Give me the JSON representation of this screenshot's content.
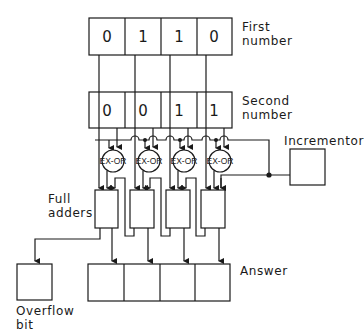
{
  "diagram": {
    "first_number": {
      "label": "First\nnumber",
      "label_lines": [
        "First",
        "number"
      ],
      "bits": [
        "0",
        "1",
        "1",
        "0"
      ]
    },
    "second_number": {
      "label_lines": [
        "Second",
        "number"
      ],
      "bits": [
        "0",
        "0",
        "1",
        "1"
      ]
    },
    "gates": {
      "label": "EX-OR",
      "count": 4
    },
    "full_adders": {
      "label_lines": [
        "Full",
        "adders"
      ],
      "count": 4
    },
    "incrementor": {
      "label": "Incrementor"
    },
    "answer": {
      "label": "Answer",
      "bits": [
        "",
        "",
        "",
        ""
      ]
    },
    "overflow": {
      "label_lines": [
        "Overflow",
        "bit"
      ]
    }
  },
  "colors": {
    "line": "#1a1a1a",
    "background": "#ffffff"
  }
}
